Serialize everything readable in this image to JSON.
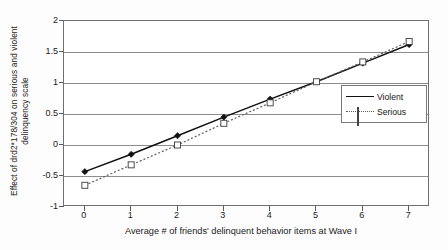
{
  "chart_data": {
    "type": "line",
    "title": "",
    "xlabel": "Average # of friends' delinquent behavior items at Wave I",
    "ylabel_line1": "Effect of drd2*178/304 on serious and violent",
    "ylabel_line2": "delinquency scale",
    "x": [
      0,
      1,
      2,
      3,
      4,
      5,
      6,
      7
    ],
    "xticklabels": [
      "0",
      "1",
      "2",
      "3",
      "4",
      "5",
      "6",
      "7"
    ],
    "yticklabels": [
      "2",
      "1.5",
      "1",
      "0.5",
      "0",
      "-0.5",
      "-1"
    ],
    "ytickvalues": [
      2,
      1.5,
      1,
      0.5,
      0,
      -0.5,
      -1
    ],
    "xlim": [
      -0.45,
      7.45
    ],
    "ylim": [
      -1,
      2
    ],
    "grid": "horizontal",
    "legend_position": "right-inside",
    "series": [
      {
        "name": "Violent",
        "marker": "filled-diamond",
        "linestyle": "solid",
        "color": "#111111",
        "values": [
          -0.43,
          -0.15,
          0.15,
          0.45,
          0.74,
          1.02,
          1.32,
          1.62
        ]
      },
      {
        "name": "Serious",
        "marker": "open-square",
        "linestyle": "dotted",
        "color": "#5f5f5f",
        "values": [
          -0.65,
          -0.32,
          0.0,
          0.35,
          0.68,
          1.02,
          1.34,
          1.67
        ]
      }
    ]
  },
  "legend": {
    "entries": [
      {
        "label": "Violent"
      },
      {
        "label": "Serious"
      }
    ]
  },
  "colors": {
    "violent": "#111111",
    "serious": "#5f5f5f",
    "grid": "#8c8c8c",
    "frame": "#6f6f6f",
    "text": "#1b1b1b",
    "plot_bg": "#ffffff",
    "page_bg": "#fdfdfd"
  }
}
